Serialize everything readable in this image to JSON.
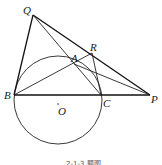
{
  "figure": {
    "points": {
      "Q": {
        "label": "Q",
        "x": 33,
        "y": 15
      },
      "R": {
        "label": "R",
        "x": 92,
        "y": 53
      },
      "A": {
        "label": "A",
        "x": 74,
        "y": 64
      },
      "B": {
        "label": "B",
        "x": 14,
        "y": 95
      },
      "C": {
        "label": "C",
        "x": 101,
        "y": 95
      },
      "P": {
        "label": "P",
        "x": 150,
        "y": 95
      },
      "O": {
        "label": "O",
        "x": 58,
        "y": 106
      }
    },
    "circle": {
      "cx": 58,
      "cy": 100,
      "r": 44
    },
    "segments": [
      [
        "Q",
        "B"
      ],
      [
        "Q",
        "P"
      ],
      [
        "Q",
        "C"
      ],
      [
        "B",
        "R"
      ],
      [
        "R",
        "C"
      ],
      [
        "B",
        "P"
      ],
      [
        "A",
        "P"
      ]
    ],
    "caption": "2-1-3 题图"
  },
  "colors": {
    "stroke": "#222222",
    "label": "#1a1a1a",
    "background": "#ffffff"
  }
}
